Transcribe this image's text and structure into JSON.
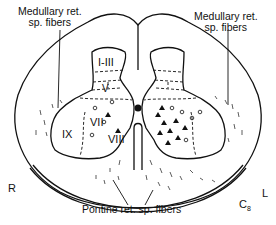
{
  "labels": {
    "medullary_left_line1": "Medullary ret.",
    "medullary_left_line2": "sp. fibers",
    "medullary_right_line1": "Medullary ret.",
    "medullary_right_line2": "sp. fibers",
    "pontine": "Pontine ret. sp. fibers",
    "side_right": "R",
    "side_left": "L",
    "segment": "C",
    "segment_sub": "8"
  },
  "laminae": {
    "l1_3": "I-III",
    "l5": "V",
    "l7": "VII",
    "l8": "VIII",
    "l9": "IX"
  },
  "colors": {
    "ink": "#111111",
    "background": "#ffffff"
  }
}
